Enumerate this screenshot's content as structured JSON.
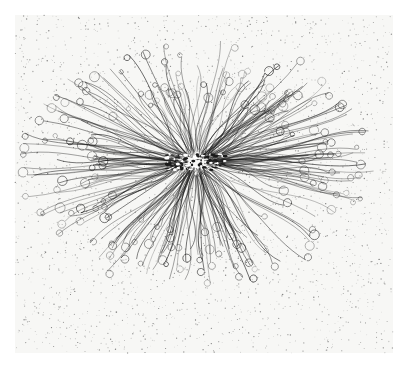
{
  "artwork": {
    "subject": "radiating tangled ink lines",
    "colors": {
      "background": "#ffffff",
      "paper": "#f7f7f5",
      "ink": "#1a1a1a",
      "speckle": "#555555"
    },
    "canvas": {
      "width": 405,
      "height": 368
    },
    "paper_rect": {
      "x": 15,
      "y": 15,
      "w": 378,
      "h": 338
    },
    "center": {
      "x": 196,
      "y": 162
    },
    "radii": {
      "rx": 170,
      "ry": 120
    },
    "line_count": 260,
    "speckle_count": 2600
  }
}
